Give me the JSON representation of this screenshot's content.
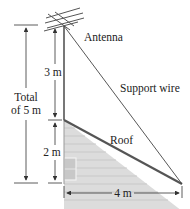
{
  "labels": {
    "antenna": "Antenna",
    "support_wire": "Support wire",
    "roof": "Roof",
    "mast_height": "3 m",
    "house_height": "2 m",
    "total_line1": "Total",
    "total_line2": "of 5 m",
    "ground_distance": "4 m"
  },
  "colors": {
    "line": "#333333",
    "house_fill": "#dcdcdc",
    "siding": "#c6c6c6",
    "roof": "#555555"
  }
}
